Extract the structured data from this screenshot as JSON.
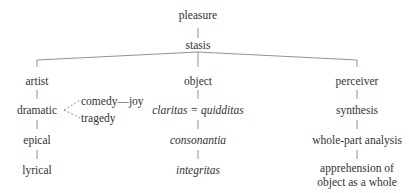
{
  "diagram": {
    "root": "pleasure",
    "center": "stasis",
    "branches": [
      {
        "head": "artist",
        "items": [
          "dramatic",
          "epical",
          "lyrical"
        ],
        "dramatic_subitems": [
          "comedy—joy",
          "tragedy"
        ]
      },
      {
        "head": "object",
        "items": [
          "claritas = quidditas",
          "consonantia",
          "integritas"
        ],
        "italic": true
      },
      {
        "head": "perceiver",
        "items": [
          "synthesis",
          "whole-part analysis",
          "apprehension of",
          "object as a whole"
        ]
      }
    ],
    "colors": {
      "line": "#777777",
      "text": "#333333"
    }
  }
}
